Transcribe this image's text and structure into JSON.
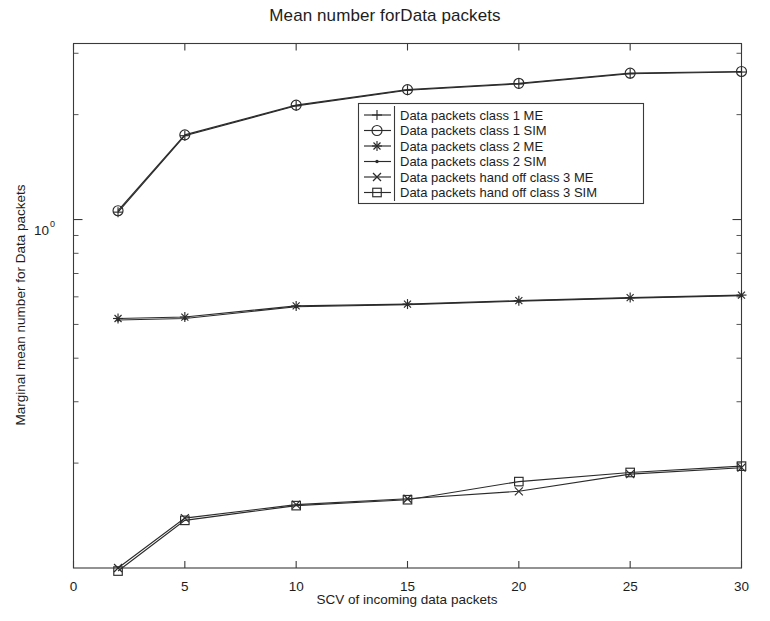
{
  "chart_data": {
    "type": "line",
    "title": "Mean number forData packets",
    "xlabel": "SCV of incoming data packets",
    "ylabel": "Marginal mean number for Data packets",
    "xlim": [
      0,
      30
    ],
    "xticks": [
      0,
      5,
      10,
      15,
      20,
      25,
      30
    ],
    "xtick_labels": [
      "0",
      "5",
      "10",
      "15",
      "20",
      "25",
      "30"
    ],
    "yscale": "log",
    "ylim": [
      0.1,
      3.2
    ],
    "yticks": [
      1
    ],
    "ytick_labels": [
      "10^0"
    ],
    "ytick_mantissa": "10",
    "ytick_exponent": "0",
    "grid": false,
    "legend_position": "upper center",
    "x": [
      2,
      5,
      10,
      15,
      20,
      25,
      30
    ],
    "series": [
      {
        "name": "Data packets class 1 ME",
        "marker": "plus",
        "values": [
          1.05,
          1.74,
          2.12,
          2.35,
          2.45,
          2.62,
          2.65
        ]
      },
      {
        "name": "Data packets class 1 SIM",
        "marker": "circle",
        "values": [
          1.06,
          1.75,
          2.13,
          2.36,
          2.46,
          2.63,
          2.66
        ]
      },
      {
        "name": "Data packets class 2 ME",
        "marker": "asterisk",
        "values": [
          0.52,
          0.525,
          0.565,
          0.572,
          0.585,
          0.597,
          0.607
        ]
      },
      {
        "name": "Data packets class 2 SIM",
        "marker": "dot",
        "values": [
          0.515,
          0.52,
          0.562,
          0.57,
          0.583,
          0.595,
          0.605
        ]
      },
      {
        "name": "Data packets hand off class 3 ME",
        "marker": "x-cross",
        "values": [
          0.1,
          0.139,
          0.152,
          0.158,
          0.166,
          0.186,
          0.194
        ]
      },
      {
        "name": "Data packets hand off class 3 SIM",
        "marker": "square",
        "values": [
          0.098,
          0.137,
          0.151,
          0.157,
          0.177,
          0.188,
          0.196
        ]
      }
    ]
  },
  "legend": {
    "entries": [
      {
        "label": "Data packets class 1 ME"
      },
      {
        "label": "Data packets class 1 SIM"
      },
      {
        "label": "Data packets class 2 ME"
      },
      {
        "label": "Data packets class 2 SIM"
      },
      {
        "label": "Data packets hand off class 3 ME"
      },
      {
        "label": "Data packets hand off class 3 SIM"
      }
    ]
  },
  "colors": {
    "line": "#2b2b2b",
    "axis": "#3a3a3a",
    "text": "#1d1d1d",
    "background": "#ffffff"
  }
}
